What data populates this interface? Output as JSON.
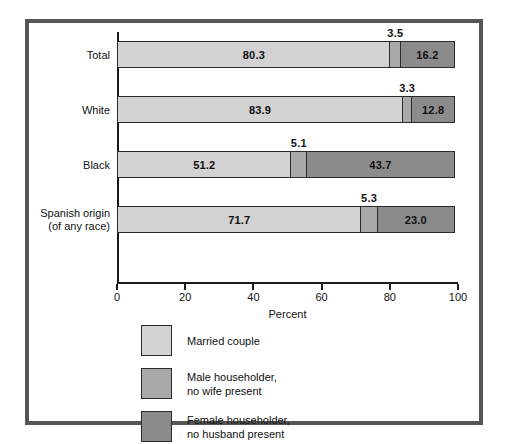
{
  "chart_data": {
    "type": "bar",
    "orientation": "horizontal",
    "stacked": true,
    "title": "",
    "xlabel": "Percent",
    "ylabel": "",
    "xlim": [
      0,
      100
    ],
    "xticks": [
      0,
      20,
      40,
      60,
      80,
      100
    ],
    "xtick_labels": [
      "0",
      "20",
      "40",
      "60",
      "80",
      "100"
    ],
    "grid": false,
    "legend_position": "below-left",
    "categories": [
      "Total",
      "White",
      "Black",
      "Spanish origin\n(of any race)"
    ],
    "series": [
      {
        "name": "Married couple",
        "color": "#d2d2d2",
        "values": [
          80.3,
          83.9,
          51.2,
          71.7
        ],
        "labels": [
          "80.3",
          "83.9",
          "51.2",
          "71.7"
        ],
        "label_placement": "inside"
      },
      {
        "name": "Male householder,\nno wife present",
        "color": "#a9a9a9",
        "values": [
          3.5,
          3.3,
          5.1,
          5.3
        ],
        "labels": [
          "3.5",
          "3.3",
          "5.1",
          "5.3"
        ],
        "label_placement": "outside-above"
      },
      {
        "name": "Female householder,\nno husband present",
        "color": "#8b8b8b",
        "values": [
          16.2,
          12.8,
          43.7,
          23.0
        ],
        "labels": [
          "16.2",
          "12.8",
          "43.7",
          "23.0"
        ],
        "label_placement": "inside"
      }
    ]
  },
  "legend": {
    "items": [
      {
        "label": "Married couple",
        "color": "#d2d2d2"
      },
      {
        "label": "Male householder,\nno wife present",
        "color": "#a9a9a9"
      },
      {
        "label": "Female householder,\nno husband present",
        "color": "#8b8b8b"
      }
    ]
  },
  "frame": {
    "border_color": "#555557",
    "background": "#ffffff"
  }
}
